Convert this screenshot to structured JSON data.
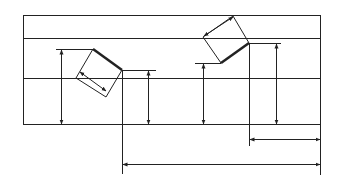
{
  "diagram": {
    "title": "",
    "type": "technical dimension drawing",
    "colors": {
      "stroke": "#222222",
      "background": "#ffffff"
    },
    "frame": {
      "x1": 23,
      "x2": 321,
      "rail_lines_y": [
        15,
        38,
        79,
        125
      ]
    },
    "left_part": {
      "label": "",
      "bold_edge": [
        [
          93,
          49
        ],
        [
          122,
          70
        ]
      ],
      "outline": [
        [
          93,
          49
        ],
        [
          122,
          70
        ],
        [
          106,
          97
        ],
        [
          76,
          78
        ]
      ],
      "diag_dim": [
        [
          79,
          72
        ],
        [
          106,
          91
        ]
      ]
    },
    "right_part": {
      "label": "",
      "bold_edge": [
        [
          221,
          63
        ],
        [
          249,
          43
        ]
      ],
      "outline": [
        [
          203,
          37
        ],
        [
          233,
          16
        ],
        [
          249,
          43
        ],
        [
          221,
          63
        ]
      ],
      "diag_dim": [
        [
          204,
          36
        ],
        [
          233,
          17
        ]
      ]
    },
    "dimension_labels": []
  }
}
